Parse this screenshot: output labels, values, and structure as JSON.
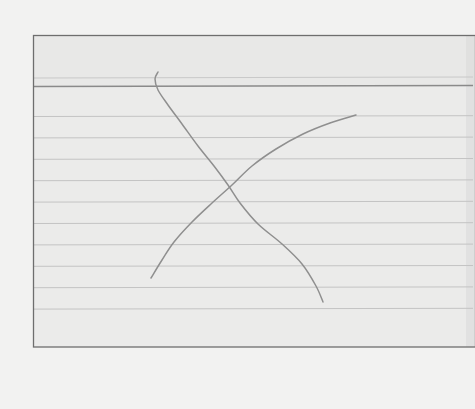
{
  "scene": {
    "description": "Photo of a ruled index card with two hand-drawn pencil curves crossing to form an X",
    "colors": {
      "background": "#f2f2f1",
      "card": "#ebebea",
      "card_header": "#e8e8e7",
      "card_border": "#6e6e6e",
      "header_rule": "#8a8a8a",
      "faint_rule": "#c9c9c9",
      "ruled_line": "#c4c4c4",
      "pencil": "#8f8f8f",
      "right_shadow": "#dadada"
    },
    "card": {
      "ruled_line_count": 10,
      "has_header_band": true
    },
    "strokes": [
      {
        "name": "pencil-curve-descending",
        "points": [
          [
            158,
            72
          ],
          [
            155,
            79
          ],
          [
            158,
            90
          ],
          [
            168,
            105
          ],
          [
            182,
            124
          ],
          [
            198,
            146
          ],
          [
            214,
            166
          ],
          [
            228,
            185
          ],
          [
            240,
            203
          ],
          [
            258,
            224
          ],
          [
            282,
            244
          ],
          [
            302,
            264
          ],
          [
            316,
            286
          ],
          [
            323,
            302
          ]
        ]
      },
      {
        "name": "pencil-curve-ascending",
        "points": [
          [
            356,
            115
          ],
          [
            330,
            123
          ],
          [
            303,
            134
          ],
          [
            276,
            149
          ],
          [
            252,
            166
          ],
          [
            232,
            185
          ],
          [
            212,
            203
          ],
          [
            192,
            222
          ],
          [
            174,
            242
          ],
          [
            162,
            260
          ],
          [
            151,
            278
          ]
        ]
      }
    ]
  }
}
